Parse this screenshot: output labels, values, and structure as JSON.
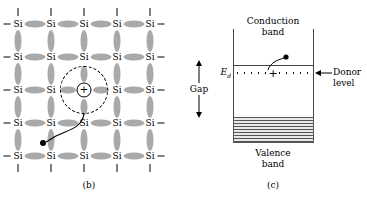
{
  "figure": {
    "panels": [
      {
        "id": "b",
        "caption": "(b)",
        "type": "silicon-lattice-with-donor",
        "atom_label": "Si",
        "columns": 5,
        "rows": 5,
        "col_x": [
          18,
          51,
          84,
          117,
          150
        ],
        "row_y": [
          24,
          57,
          90,
          123,
          156
        ],
        "donor": {
          "symbol": "+",
          "x": 84,
          "y": 90,
          "core_radius": 7.5,
          "orbit_radius": 24
        },
        "free_electron": {
          "x": 43,
          "y": 143,
          "radius": 3
        }
      },
      {
        "id": "c",
        "caption": "(c)",
        "type": "band-diagram-donor-level",
        "conduction_band_label": "Conduction\nband",
        "conduction_band_line1": "Conduction",
        "conduction_band_line2": "band",
        "valence_band_line1": "Valence",
        "valence_band_line2": "band",
        "gap_label": "Gap",
        "donor_level_line1": "Donor",
        "donor_level_line2": "level",
        "energy_symbol": "E",
        "energy_subscript": "d",
        "ionized_donor_symbol": "+",
        "levels": {
          "conduction_band_min_y": 65,
          "donor_level_y": 73,
          "valence_band_max_y": 117,
          "box_left_x": 233,
          "box_right_x": 313,
          "box_top_y": 29,
          "box_bottom_y": 142
        }
      }
    ]
  },
  "colors": {
    "bond": "#a9a9a9",
    "line": "#444444",
    "ink": "#000000",
    "hatch": "#555555",
    "background": "#ffffff"
  }
}
